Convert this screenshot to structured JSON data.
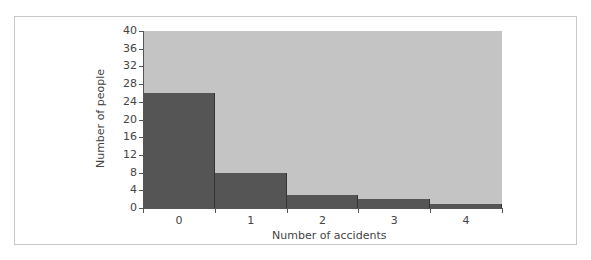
{
  "chart_data": {
    "type": "bar",
    "title": "",
    "xlabel": "Number of accidents",
    "ylabel": "Number of people",
    "categories": [
      "0",
      "1",
      "2",
      "3",
      "4"
    ],
    "values": [
      26,
      8,
      3,
      2,
      1
    ],
    "ylim": [
      0,
      40
    ],
    "yticks": [
      "0",
      "4",
      "8",
      "12",
      "16",
      "20",
      "24",
      "28",
      "32",
      "36",
      "40"
    ],
    "grid": false,
    "legend": null,
    "colors": {
      "bar": "#555555",
      "plot_background": "#c4c4c4",
      "frame_border": "#c8c8c8"
    }
  }
}
